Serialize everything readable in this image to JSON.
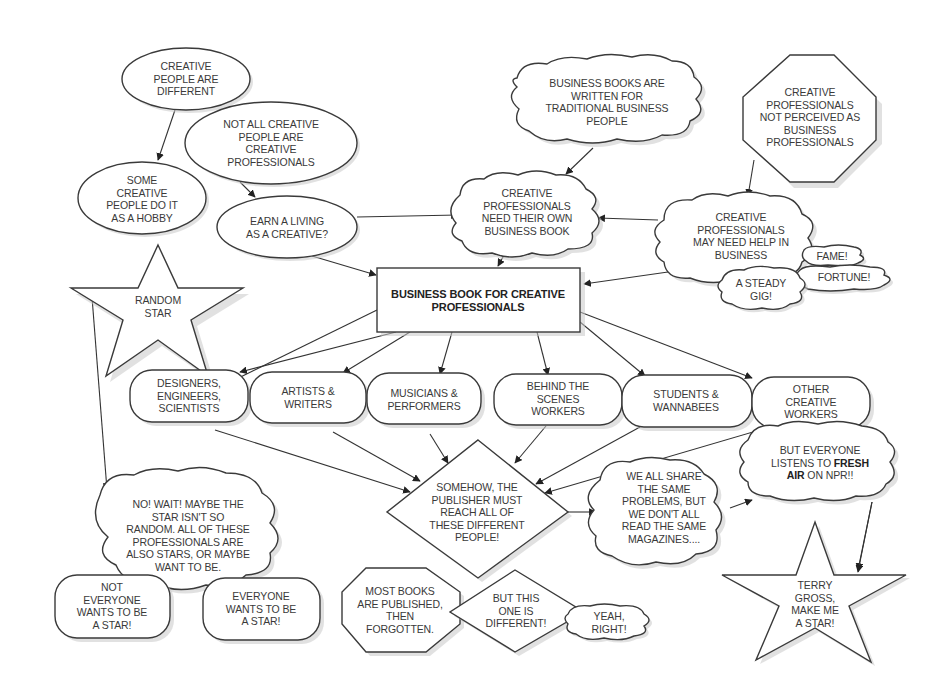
{
  "diagram": {
    "nodes": [
      {
        "id": "creative_people_different",
        "shape": "ellipse",
        "text": "CREATIVE\nPEOPLE ARE\nDIFFERENT"
      },
      {
        "id": "not_all_creative",
        "shape": "ellipse",
        "text": "NOT ALL CREATIVE\nPEOPLE ARE\nCREATIVE\nPROFESSIONALS"
      },
      {
        "id": "hobby",
        "shape": "ellipse",
        "text": "SOME\nCREATIVE\nPEOPLE DO IT\nAS A HOBBY"
      },
      {
        "id": "earn_living",
        "shape": "ellipse",
        "text": "EARN A LIVING\nAS A CREATIVE?"
      },
      {
        "id": "books_traditional",
        "shape": "cloud",
        "text": "BUSINESS BOOKS ARE\nWRITTEN FOR\nTRADITIONAL BUSINESS\nPEOPLE"
      },
      {
        "id": "not_perceived",
        "shape": "octagon",
        "text": "CREATIVE\nPROFESSIONALS\nNOT PERCEIVED AS\nBUSINESS\nPROFESSIONALS"
      },
      {
        "id": "need_own_book",
        "shape": "cloud",
        "text": "CREATIVE\nPROFESSIONALS\nNEED THEIR OWN\nBUSINESS BOOK"
      },
      {
        "id": "need_help",
        "shape": "cloud",
        "text": "CREATIVE\nPROFESSIONALS\nMAY NEED HELP IN\nBUSINESS"
      },
      {
        "id": "fame",
        "shape": "cloud",
        "text": "FAME!"
      },
      {
        "id": "fortune",
        "shape": "cloud",
        "text": "FORTUNE!"
      },
      {
        "id": "steady_gig",
        "shape": "cloud",
        "text": "A STEADY\nGIG!"
      },
      {
        "id": "random_star",
        "shape": "star",
        "text": "RANDOM\nSTAR"
      },
      {
        "id": "main_book",
        "shape": "rectangle",
        "text": "BUSINESS BOOK FOR CREATIVE\nPROFESSIONALS"
      },
      {
        "id": "designers",
        "shape": "pill",
        "text": "DESIGNERS,\nENGINEERS,\nSCIENTISTS"
      },
      {
        "id": "artists",
        "shape": "pill",
        "text": "ARTISTS &\nWRITERS"
      },
      {
        "id": "musicians",
        "shape": "pill",
        "text": "MUSICIANS &\nPERFORMERS"
      },
      {
        "id": "behind_scenes",
        "shape": "pill",
        "text": "BEHIND THE\nSCENES\nWORKERS"
      },
      {
        "id": "students",
        "shape": "pill",
        "text": "STUDENTS &\nWANNABEES"
      },
      {
        "id": "other_creative",
        "shape": "pill",
        "text": "OTHER\nCREATIVE\nWORKERS"
      },
      {
        "id": "publisher_reach",
        "shape": "diamond",
        "text": "SOMEHOW, THE\nPUBLISHER MUST\nREACH ALL OF\nTHESE DIFFERENT\nPEOPLE!"
      },
      {
        "id": "share_problems",
        "shape": "cloud",
        "text": "WE ALL SHARE\nTHE SAME\nPROBLEMS, BUT\nWE DON'T ALL\nREAD THE SAME\nMAGAZINES...."
      },
      {
        "id": "fresh_air",
        "shape": "cloud",
        "text_parts": [
          "BUT EVERYONE\nLISTENS TO ",
          "FRESH\nAIR",
          " ON NPR!!"
        ]
      },
      {
        "id": "terry_gross",
        "shape": "star",
        "text": "TERRY\nGROSS,\nMAKE ME\nA STAR!"
      },
      {
        "id": "no_wait",
        "shape": "cloud",
        "text": "NO! WAIT! MAYBE THE\nSTAR ISN'T SO\nRANDOM. ALL OF THESE\nPROFESSIONALS ARE\nALSO STARS, OR MAYBE\nWANT TO BE."
      },
      {
        "id": "not_everyone_star",
        "shape": "pill",
        "text": "NOT\nEVERYONE\nWANTS TO BE\nA STAR!"
      },
      {
        "id": "everyone_star",
        "shape": "pill",
        "text": "EVERYONE\nWANTS TO BE\nA STAR!"
      },
      {
        "id": "most_books",
        "shape": "octagon",
        "text": "MOST BOOKS\nARE PUBLISHED,\nTHEN\nFORGOTTEN."
      },
      {
        "id": "this_one_different",
        "shape": "diamond",
        "text": "BUT THIS\nONE IS\nDIFFERENT!"
      },
      {
        "id": "yeah_right",
        "shape": "cloud",
        "text": "YEAH,\nRIGHT!"
      }
    ],
    "edges": [
      {
        "from": "creative_people_different",
        "to": "hobby"
      },
      {
        "from": "not_all_creative",
        "to": "earn_living"
      },
      {
        "from": "earn_living",
        "to": "need_own_book"
      },
      {
        "from": "earn_living",
        "to": "main_book"
      },
      {
        "from": "books_traditional",
        "to": "need_own_book"
      },
      {
        "from": "not_perceived",
        "to": "need_help"
      },
      {
        "from": "need_help",
        "to": "need_own_book"
      },
      {
        "from": "need_help",
        "to": "main_book"
      },
      {
        "from": "need_own_book",
        "to": "main_book"
      },
      {
        "from": "main_book",
        "to": "designers"
      },
      {
        "from": "main_book",
        "to": "artists"
      },
      {
        "from": "main_book",
        "to": "musicians"
      },
      {
        "from": "main_book",
        "to": "behind_scenes"
      },
      {
        "from": "main_book",
        "to": "students"
      },
      {
        "from": "main_book",
        "to": "other_creative"
      },
      {
        "from": "designers",
        "to": "publisher_reach"
      },
      {
        "from": "artists",
        "to": "publisher_reach"
      },
      {
        "from": "musicians",
        "to": "publisher_reach"
      },
      {
        "from": "behind_scenes",
        "to": "publisher_reach"
      },
      {
        "from": "students",
        "to": "publisher_reach"
      },
      {
        "from": "other_creative",
        "to": "publisher_reach"
      },
      {
        "from": "publisher_reach",
        "to": "share_problems"
      },
      {
        "from": "share_problems",
        "to": "fresh_air"
      },
      {
        "from": "fresh_air",
        "to": "terry_gross"
      },
      {
        "from": "random_star",
        "to": "no_wait"
      },
      {
        "from": "main_book",
        "to": "random_star",
        "arrow": false
      }
    ]
  },
  "colors": {
    "stroke": "#3a3a3a",
    "fill": "#ffffff",
    "shadow": "#c8c8c8",
    "text": "#3a3a3a"
  }
}
